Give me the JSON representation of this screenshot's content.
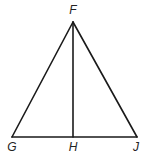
{
  "diagram": {
    "type": "geometry",
    "points": {
      "F": {
        "label": "F",
        "x": 73,
        "y": 22
      },
      "G": {
        "label": "G",
        "x": 12,
        "y": 137
      },
      "H": {
        "label": "H",
        "x": 73,
        "y": 137
      },
      "J": {
        "label": "J",
        "x": 137,
        "y": 137
      }
    },
    "segments": [
      "FG",
      "FJ",
      "GJ",
      "FH"
    ],
    "colors": {
      "stroke": "#1a1a1a",
      "label": "#222222",
      "background": "#ffffff"
    }
  }
}
